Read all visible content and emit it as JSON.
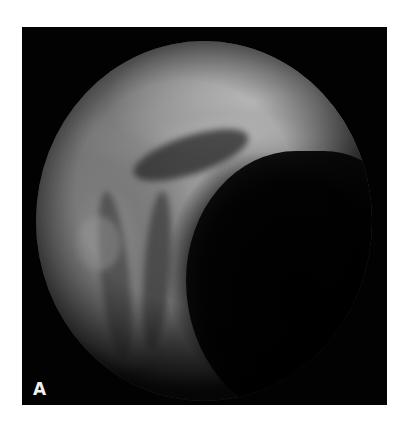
{
  "figure": {
    "panel_label": "A",
    "colors": {
      "frame": "#020202",
      "background": "#ffffff",
      "label": "#f2f2f2",
      "rim_highlight": "#b8b8b8",
      "lumen": "#000000"
    }
  }
}
